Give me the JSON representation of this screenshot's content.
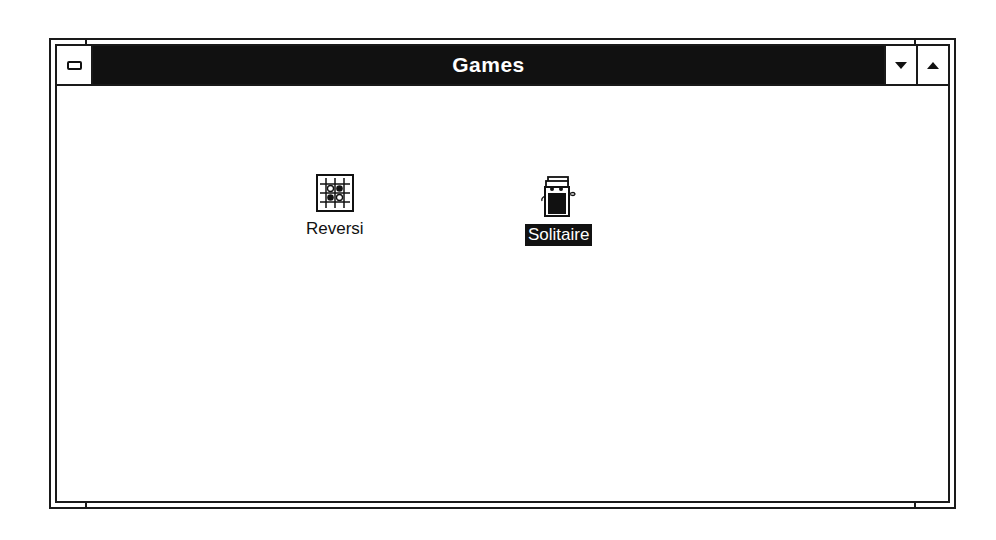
{
  "window": {
    "title": "Games",
    "controls": {
      "system_menu": "system-menu-icon",
      "minimize": "minimize-arrow-icon",
      "maximize": "maximize-arrow-icon"
    }
  },
  "icons": [
    {
      "label": "Reversi",
      "icon": "reversi-board-icon",
      "selected": false
    },
    {
      "label": "Solitaire",
      "icon": "solitaire-card-deck-icon",
      "selected": true
    }
  ],
  "colors": {
    "titlebar": "#111111",
    "title_text": "#ffffff",
    "selection": "#111111",
    "background": "#ffffff"
  }
}
